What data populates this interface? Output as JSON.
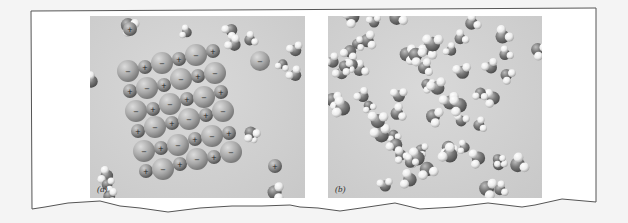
{
  "figure": {
    "panels": [
      {
        "label": "(a)",
        "description": "Ionic crystal lattice of alternating positive and negative ions dissolving among water molecules",
        "ion_signs": {
          "positive": "+",
          "negative": "−"
        }
      },
      {
        "label": "(b)",
        "description": "Molecular substance dissolved in water; individual molecules dispersed among water molecules"
      }
    ],
    "colors": {
      "page_background": "#f4f4f4",
      "frame_fill": "#ffffff",
      "frame_stroke": "#555555",
      "panel_background": "#d0d0d0",
      "dark_atom": "#7a7a7a",
      "light_atom": "#ececec",
      "ion_large": "#a8a8a8",
      "ion_small": "#8c8c8c"
    }
  }
}
